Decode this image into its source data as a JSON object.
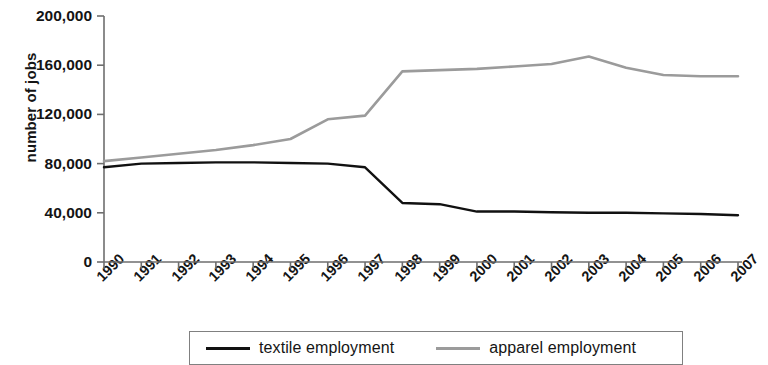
{
  "chart_data": {
    "type": "line",
    "title": "",
    "subtitle": "",
    "xlabel": "",
    "ylabel": "number of jobs",
    "grid": false,
    "legend_position": "bottom",
    "xlim": [
      1990,
      2007
    ],
    "ylim": [
      0,
      200000
    ],
    "y_ticks": [
      0,
      40000,
      80000,
      120000,
      160000,
      200000
    ],
    "y_tick_labels": [
      "0",
      "40,000",
      "80,000",
      "120,000",
      "160,000",
      "200,000"
    ],
    "categories": [
      1990,
      1991,
      1992,
      1993,
      1994,
      1995,
      1996,
      1997,
      1998,
      1999,
      2000,
      2001,
      2002,
      2003,
      2004,
      2005,
      2006,
      2007
    ],
    "x_tick_labels": [
      "1990",
      "1991",
      "1992",
      "1993",
      "1994",
      "1995",
      "1996",
      "1997",
      "1998",
      "1999",
      "2000",
      "2001",
      "2002",
      "2003",
      "2004",
      "2005",
      "2006",
      "2007"
    ],
    "series": [
      {
        "name": "textile employment",
        "color": "#111111",
        "values": [
          77000,
          80000,
          80500,
          81000,
          81000,
          80500,
          80000,
          77000,
          48000,
          47000,
          41000,
          41000,
          40500,
          40000,
          40000,
          39500,
          39000,
          38000
        ]
      },
      {
        "name": "apparel employment",
        "color": "#9b9b9b",
        "values": [
          82000,
          85000,
          88000,
          91000,
          95000,
          100000,
          116000,
          119000,
          155000,
          156000,
          157000,
          159000,
          161000,
          167000,
          158000,
          152000,
          151000,
          151000
        ]
      }
    ]
  },
  "legend": {
    "entries": [
      {
        "label": "textile employment"
      },
      {
        "label": "apparel employment"
      }
    ]
  }
}
